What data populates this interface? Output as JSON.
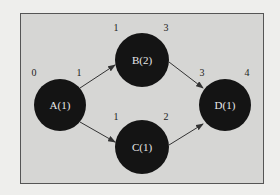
{
  "diagram": {
    "colors": {
      "background": "#d6d6d4",
      "node_fill": "#141414",
      "edge": "#333333",
      "label": "#e8e8e8"
    },
    "nodes": [
      {
        "id": "A",
        "label": "A(1)",
        "early_start": "0",
        "early_finish": "1"
      },
      {
        "id": "B",
        "label": "B(2)",
        "early_start": "1",
        "early_finish": "3"
      },
      {
        "id": "C",
        "label": "C(1)",
        "early_start": "1",
        "early_finish": "2"
      },
      {
        "id": "D",
        "label": "D(1)",
        "early_start": "3",
        "early_finish": "4"
      }
    ],
    "edges": [
      {
        "from": "A",
        "to": "B"
      },
      {
        "from": "A",
        "to": "C"
      },
      {
        "from": "B",
        "to": "D"
      },
      {
        "from": "C",
        "to": "D"
      }
    ]
  }
}
